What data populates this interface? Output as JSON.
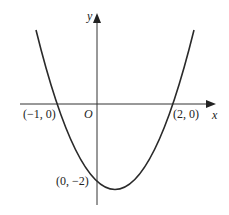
{
  "diagram": {
    "type": "parabola-graph",
    "axes": {
      "x_label": "x",
      "y_label": "y",
      "origin_label": "O"
    },
    "points": [
      {
        "label": "(−1, 0)",
        "x": -1,
        "y": 0
      },
      {
        "label": "(2, 0)",
        "x": 2,
        "y": 0
      },
      {
        "label": "(0, −2)",
        "x": 0,
        "y": -2
      }
    ],
    "colors": {
      "curve": "#2a2a2a",
      "axes": "#333333",
      "text": "#222222"
    }
  }
}
